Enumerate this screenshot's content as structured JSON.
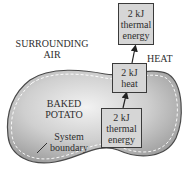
{
  "diagram": {
    "type": "energy-transfer-system-diagram",
    "regions": {
      "surroundings": {
        "line1": "SURROUNDING",
        "line2": "AIR"
      },
      "system": {
        "line1": "BAKED",
        "line2": "POTATO"
      }
    },
    "boundary_label": {
      "line1": "System",
      "line2": "boundary"
    },
    "transfer_label": "HEAT",
    "boxes": {
      "system_thermal": {
        "line1": "2 kJ",
        "line2": "thermal",
        "line3": "energy"
      },
      "heat": {
        "line1": "2 kJ",
        "line2": "heat"
      },
      "surroundings_thermal": {
        "line1": "2 kJ",
        "line2": "thermal",
        "line3": "energy"
      }
    },
    "colors": {
      "potato_fill": "#bdbdbd",
      "box_fill": "#d6d6d6",
      "outline": "#3a3a3a",
      "background": "#ffffff"
    }
  }
}
